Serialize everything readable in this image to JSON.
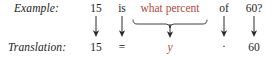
{
  "figure": {
    "kind": "math-word-problem-translation",
    "background_color": "#ffffff",
    "text_color": "#1c1c1c",
    "accent_color": "#b2483c"
  },
  "rows": {
    "example": {
      "label": "Example:",
      "tokens": [
        {
          "text": "15",
          "color": "#1c1c1c",
          "x": 96,
          "style": "normal"
        },
        {
          "text": "is",
          "color": "#1c1c1c",
          "x": 122,
          "style": "normal"
        },
        {
          "text": "what percent",
          "color": "#b2483c",
          "x": 170,
          "style": "normal"
        },
        {
          "text": "of",
          "color": "#1c1c1c",
          "x": 224,
          "style": "normal"
        },
        {
          "text": "60?",
          "color": "#1c1c1c",
          "x": 254,
          "style": "normal"
        }
      ]
    },
    "translation": {
      "label": "Translation:",
      "tokens": [
        {
          "text": "15",
          "color": "#1c1c1c",
          "x": 96,
          "style": "normal"
        },
        {
          "text": "=",
          "color": "#1c1c1c",
          "x": 122,
          "style": "normal"
        },
        {
          "text": "y",
          "color": "#b2483c",
          "x": 170,
          "style": "italic"
        },
        {
          "text": "·",
          "color": "#1c1c1c",
          "x": 224,
          "style": "normal"
        },
        {
          "text": "60",
          "color": "#1c1c1c",
          "x": 254,
          "style": "normal"
        }
      ]
    }
  },
  "connectors": {
    "arrows": [
      {
        "name": "arrow-15",
        "x": 96
      },
      {
        "name": "arrow-is-equals",
        "x": 122
      },
      {
        "name": "arrow-percent-to-y",
        "x": 170
      },
      {
        "name": "arrow-of-times",
        "x": 224
      },
      {
        "name": "arrow-60",
        "x": 254
      }
    ],
    "brace": {
      "name": "underbrace-what-percent",
      "left": 133,
      "right": 208,
      "center": 170
    }
  }
}
